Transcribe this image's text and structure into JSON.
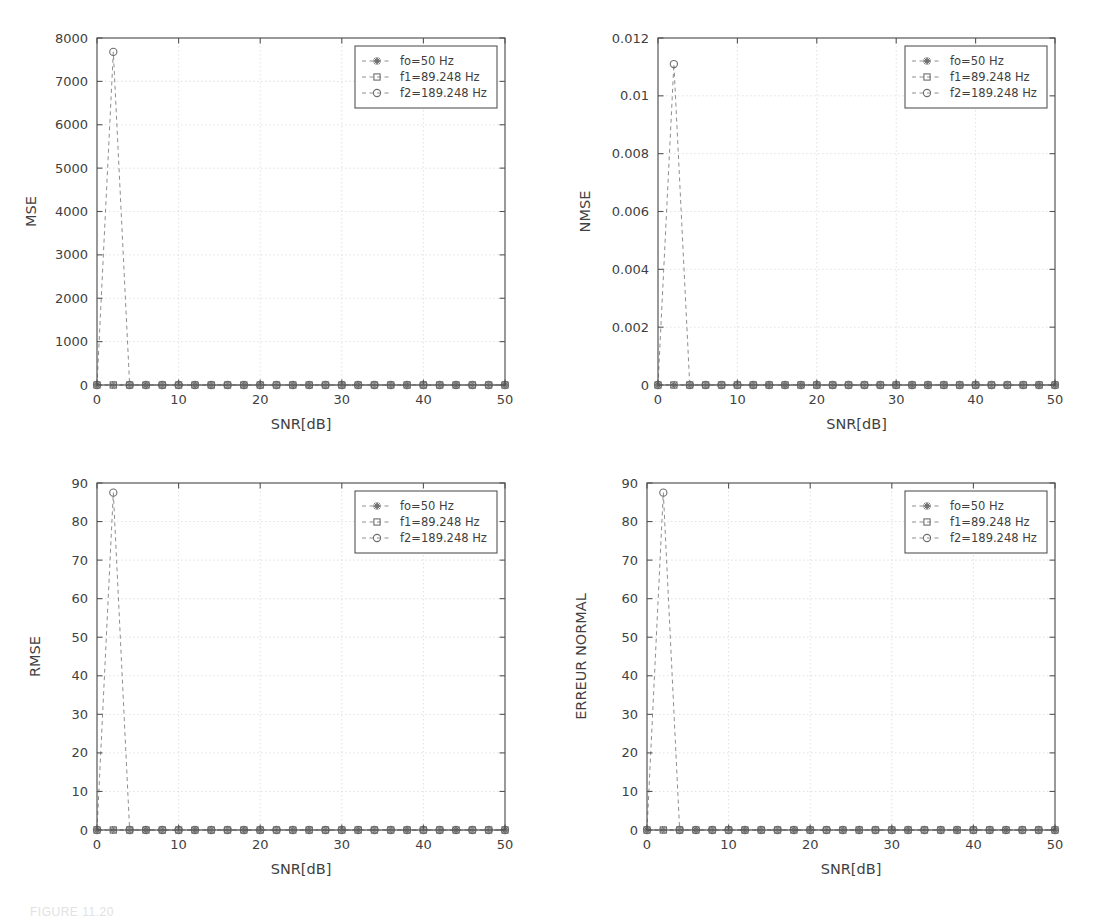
{
  "figure": {
    "caption": "FIGURE 11.20",
    "panel_count": 4,
    "grid": "2x2"
  },
  "series_styles": {
    "f0": {
      "marker": "star-marker",
      "color": "#8a8a8a",
      "linestyle": "dashed"
    },
    "f1": {
      "marker": "square-marker",
      "color": "#8a8a8a",
      "linestyle": "dashed"
    },
    "f2": {
      "marker": "circle-marker",
      "color": "#9c9c9c",
      "linestyle": "dashed"
    }
  },
  "colors": {
    "axis": "#555555",
    "grid": "#dedede",
    "line": "#8e8e8e",
    "marker": "#6d6d6d",
    "text": "#3f3f3f",
    "background": "#ffffff"
  },
  "legend": {
    "entries": [
      {
        "label": "fo=50 Hz",
        "marker": "star-marker"
      },
      {
        "label": "f1=89.248 Hz",
        "marker": "square-marker"
      },
      {
        "label": "f2=189.248 Hz",
        "marker": "circle-marker"
      }
    ]
  },
  "chart_data": [
    {
      "id": "mse",
      "type": "line",
      "title": "",
      "xlabel": "SNR[dB]",
      "ylabel": "MSE",
      "xlim": [
        0,
        50
      ],
      "ylim": [
        0,
        8000
      ],
      "xticks": [
        0,
        10,
        20,
        30,
        40,
        50
      ],
      "yticks": [
        0,
        1000,
        2000,
        3000,
        4000,
        5000,
        6000,
        7000,
        8000
      ],
      "grid": true,
      "legend_position": "upper right",
      "x": [
        0,
        2,
        4,
        6,
        8,
        10,
        12,
        14,
        16,
        18,
        20,
        22,
        24,
        26,
        28,
        30,
        32,
        34,
        36,
        38,
        40,
        42,
        44,
        46,
        48,
        50
      ],
      "series": [
        {
          "name": "fo=50 Hz",
          "marker": "star-marker",
          "values": [
            0,
            0,
            0,
            0,
            0,
            0,
            0,
            0,
            0,
            0,
            0,
            0,
            0,
            0,
            0,
            0,
            0,
            0,
            0,
            0,
            0,
            0,
            0,
            0,
            0,
            0
          ]
        },
        {
          "name": "f1=89.248 Hz",
          "marker": "square-marker",
          "values": [
            0,
            0,
            0,
            0,
            0,
            0,
            0,
            0,
            0,
            0,
            0,
            0,
            0,
            0,
            0,
            0,
            0,
            0,
            0,
            0,
            0,
            0,
            0,
            0,
            0,
            0
          ]
        },
        {
          "name": "f2=189.248 Hz",
          "marker": "circle-marker",
          "values": [
            0,
            7680,
            0,
            0,
            0,
            0,
            0,
            0,
            0,
            0,
            0,
            0,
            0,
            0,
            0,
            0,
            0,
            0,
            0,
            0,
            0,
            0,
            0,
            0,
            0,
            0
          ]
        }
      ]
    },
    {
      "id": "nmse",
      "type": "line",
      "title": "",
      "xlabel": "SNR[dB]",
      "ylabel": "NMSE",
      "xlim": [
        0,
        50
      ],
      "ylim": [
        0,
        0.012
      ],
      "xticks": [
        0,
        10,
        20,
        30,
        40,
        50
      ],
      "yticks": [
        0,
        0.002,
        0.004,
        0.006,
        0.008,
        0.01,
        0.012
      ],
      "ytick_labels": [
        "0",
        "0.002",
        "0.004",
        "0.006",
        "0.008",
        "0.01",
        "0.012"
      ],
      "grid": true,
      "legend_position": "upper right",
      "x": [
        0,
        2,
        4,
        6,
        8,
        10,
        12,
        14,
        16,
        18,
        20,
        22,
        24,
        26,
        28,
        30,
        32,
        34,
        36,
        38,
        40,
        42,
        44,
        46,
        48,
        50
      ],
      "series": [
        {
          "name": "fo=50 Hz",
          "marker": "star-marker",
          "values": [
            0,
            0,
            0,
            0,
            0,
            0,
            0,
            0,
            0,
            0,
            0,
            0,
            0,
            0,
            0,
            0,
            0,
            0,
            0,
            0,
            0,
            0,
            0,
            0,
            0,
            0
          ]
        },
        {
          "name": "f1=89.248 Hz",
          "marker": "square-marker",
          "values": [
            0,
            0,
            0,
            0,
            0,
            0,
            0,
            0,
            0,
            0,
            0,
            0,
            0,
            0,
            0,
            0,
            0,
            0,
            0,
            0,
            0,
            0,
            0,
            0,
            0,
            0
          ]
        },
        {
          "name": "f2=189.248 Hz",
          "marker": "circle-marker",
          "values": [
            0,
            0.0111,
            0,
            0,
            0,
            0,
            0,
            0,
            0,
            0,
            0,
            0,
            0,
            0,
            0,
            0,
            0,
            0,
            0,
            0,
            0,
            0,
            0,
            0,
            0,
            0
          ]
        }
      ]
    },
    {
      "id": "rmse",
      "type": "line",
      "title": "",
      "xlabel": "SNR[dB]",
      "ylabel": "RMSE",
      "xlim": [
        0,
        50
      ],
      "ylim": [
        0,
        90
      ],
      "xticks": [
        0,
        10,
        20,
        30,
        40,
        50
      ],
      "yticks": [
        0,
        10,
        20,
        30,
        40,
        50,
        60,
        70,
        80,
        90
      ],
      "grid": true,
      "legend_position": "upper right",
      "x": [
        0,
        2,
        4,
        6,
        8,
        10,
        12,
        14,
        16,
        18,
        20,
        22,
        24,
        26,
        28,
        30,
        32,
        34,
        36,
        38,
        40,
        42,
        44,
        46,
        48,
        50
      ],
      "series": [
        {
          "name": "fo=50 Hz",
          "marker": "star-marker",
          "values": [
            0,
            0,
            0,
            0,
            0,
            0,
            0,
            0,
            0,
            0,
            0,
            0,
            0,
            0,
            0,
            0,
            0,
            0,
            0,
            0,
            0,
            0,
            0,
            0,
            0,
            0
          ]
        },
        {
          "name": "f1=89.248 Hz",
          "marker": "square-marker",
          "values": [
            0,
            0,
            0,
            0,
            0,
            0,
            0,
            0,
            0,
            0,
            0,
            0,
            0,
            0,
            0,
            0,
            0,
            0,
            0,
            0,
            0,
            0,
            0,
            0,
            0,
            0
          ]
        },
        {
          "name": "f2=189.248 Hz",
          "marker": "circle-marker",
          "values": [
            0,
            87.5,
            0,
            0,
            0,
            0,
            0,
            0,
            0,
            0,
            0,
            0,
            0,
            0,
            0,
            0,
            0,
            0,
            0,
            0,
            0,
            0,
            0,
            0,
            0,
            0
          ]
        }
      ]
    },
    {
      "id": "erreur-normal",
      "type": "line",
      "title": "",
      "xlabel": "SNR[dB]",
      "ylabel": "ERREUR NORMAL",
      "xlim": [
        0,
        50
      ],
      "ylim": [
        0,
        90
      ],
      "xticks": [
        0,
        10,
        20,
        30,
        40,
        50
      ],
      "yticks": [
        0,
        10,
        20,
        30,
        40,
        50,
        60,
        70,
        80,
        90
      ],
      "grid": true,
      "legend_position": "upper right",
      "x": [
        0,
        2,
        4,
        6,
        8,
        10,
        12,
        14,
        16,
        18,
        20,
        22,
        24,
        26,
        28,
        30,
        32,
        34,
        36,
        38,
        40,
        42,
        44,
        46,
        48,
        50
      ],
      "series": [
        {
          "name": "fo=50 Hz",
          "marker": "star-marker",
          "values": [
            0,
            0,
            0,
            0,
            0,
            0,
            0,
            0,
            0,
            0,
            0,
            0,
            0,
            0,
            0,
            0,
            0,
            0,
            0,
            0,
            0,
            0,
            0,
            0,
            0,
            0
          ]
        },
        {
          "name": "f1=89.248 Hz",
          "marker": "square-marker",
          "values": [
            0,
            0,
            0,
            0,
            0,
            0,
            0,
            0,
            0,
            0,
            0,
            0,
            0,
            0,
            0,
            0,
            0,
            0,
            0,
            0,
            0,
            0,
            0,
            0,
            0,
            0
          ]
        },
        {
          "name": "f2=189.248 Hz",
          "marker": "circle-marker",
          "values": [
            0,
            87.5,
            0,
            0,
            0,
            0,
            0,
            0,
            0,
            0,
            0,
            0,
            0,
            0,
            0,
            0,
            0,
            0,
            0,
            0,
            0,
            0,
            0,
            0,
            0,
            0
          ]
        }
      ]
    }
  ],
  "panel_geometry": [
    {
      "id": "mse",
      "left": 0,
      "top": 0,
      "width": 550,
      "height": 445,
      "plot": {
        "x": 97,
        "y": 38,
        "w": 408,
        "h": 347
      },
      "ylabel_x": 36,
      "ylabel_nudge": 0
    },
    {
      "id": "nmse",
      "left": 550,
      "top": 0,
      "width": 550,
      "height": 445,
      "plot": {
        "x": 108,
        "y": 38,
        "w": 397,
        "h": 347
      },
      "ylabel_x": 40,
      "ylabel_nudge": 0
    },
    {
      "id": "rmse",
      "left": 0,
      "top": 445,
      "width": 550,
      "height": 435,
      "plot": {
        "x": 97,
        "y": 38,
        "w": 408,
        "h": 347
      },
      "ylabel_x": 40,
      "ylabel_nudge": 0
    },
    {
      "id": "erreur-normal",
      "left": 550,
      "top": 445,
      "width": 550,
      "height": 435,
      "plot": {
        "x": 97,
        "y": 38,
        "w": 408,
        "h": 347
      },
      "ylabel_x": 36,
      "ylabel_nudge": 0
    }
  ]
}
